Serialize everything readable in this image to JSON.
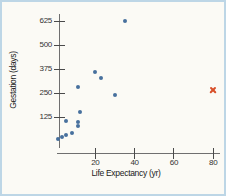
{
  "figure": {
    "background_color": "#fbfaf5",
    "border_color": "#bdd6e6"
  },
  "chart_data": {
    "type": "scatter",
    "title": "",
    "xlabel": "Life Expectancy (yr)",
    "ylabel": "Gestation (days)",
    "x_ticks": [
      "20",
      "40",
      "60",
      "80"
    ],
    "y_ticks": [
      "125",
      "250",
      "375",
      "500",
      "625"
    ],
    "xlim": [
      0,
      85
    ],
    "ylim": [
      0,
      660
    ],
    "grid": false,
    "legend": "none",
    "series": [
      {
        "name": "mammal-points",
        "marker": "dot",
        "color": "#47709d",
        "points": [
          [
            1,
            10
          ],
          [
            3,
            19
          ],
          [
            5,
            30
          ],
          [
            8,
            40
          ],
          [
            5,
            105
          ],
          [
            11,
            80
          ],
          [
            11,
            100
          ],
          [
            12,
            150
          ],
          [
            11,
            280
          ],
          [
            20,
            360
          ],
          [
            23,
            330
          ],
          [
            30,
            240
          ],
          [
            35,
            625
          ]
        ]
      },
      {
        "name": "highlighted-human-point",
        "marker": "x",
        "color": "#d8502a",
        "points": [
          [
            80,
            265
          ]
        ]
      }
    ]
  }
}
